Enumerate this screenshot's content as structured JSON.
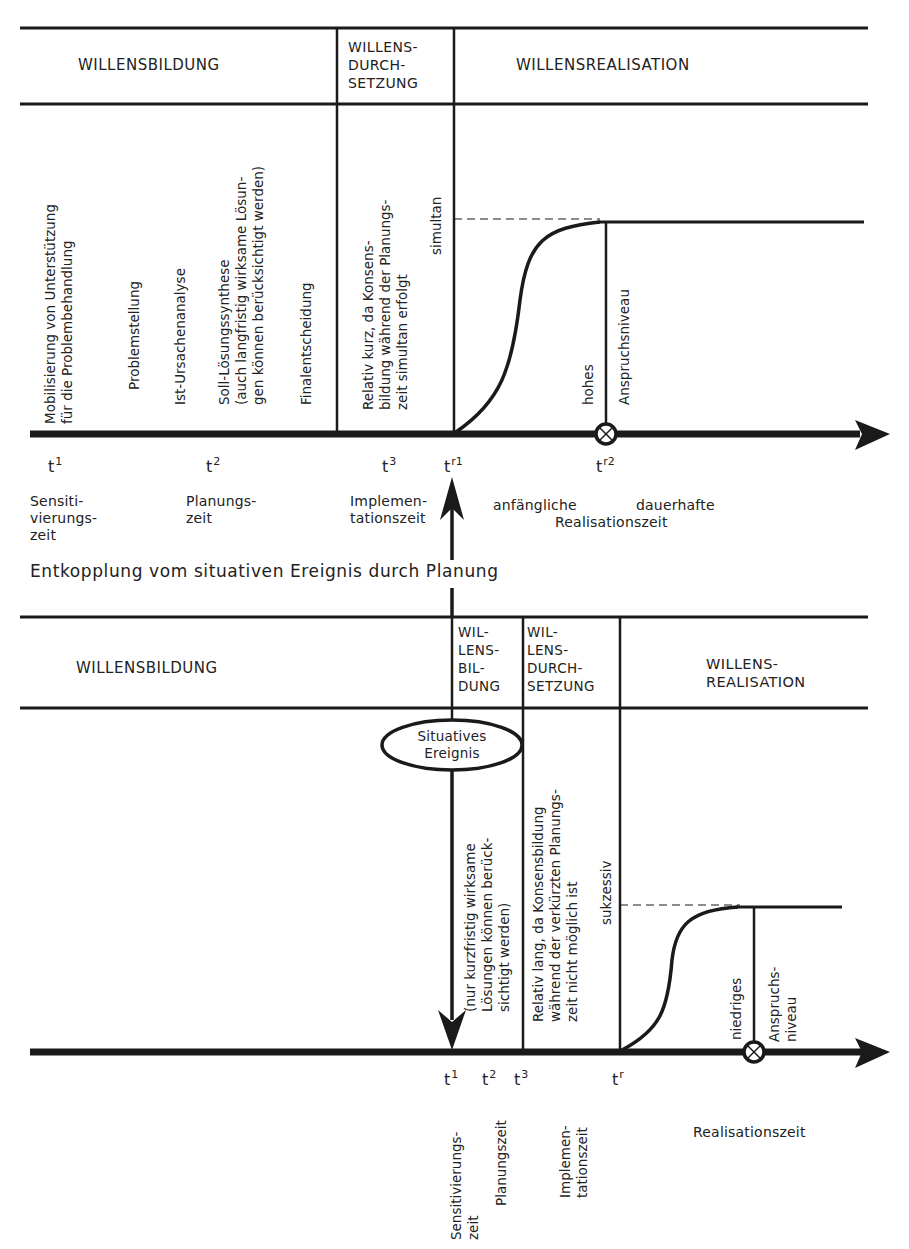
{
  "top_panel": {
    "phases": {
      "willensbildung": "WILLENSBILDUNG",
      "willensdurchsetzung": "WILLENS-\nDURCH-\nSETZUNG",
      "willensrealisation": "WILLENSREALISATION"
    },
    "activities": {
      "mobilisierung": "Mobilisierung von Unterstützung\nfür die Problembehandlung",
      "problemstellung": "Problemstellung",
      "ist_ursachenanalyse": "Ist-Ursachenanalyse",
      "soll_loesungssynthese": "Soll-Lösungssynthese\n(auch langfristig wirksame Lösun-\ngen können berücksichtigt werden)",
      "finalentscheidung": "Finalentscheidung",
      "implementation_note": "Relativ kurz, da Konsens-\nbildung während der Planungs-\nzeit simultan erfolgt",
      "simultan": "simultan",
      "hohes": "hohes",
      "anspruchsniveau": "Anspruchsniveau"
    },
    "ticks": [
      {
        "base": "t",
        "sup": "1"
      },
      {
        "base": "t",
        "sup": "2"
      },
      {
        "base": "t",
        "sup": "3"
      },
      {
        "base": "t",
        "sup": "r1"
      },
      {
        "base": "t",
        "sup": "r2"
      }
    ],
    "periods": {
      "sensitivierungszeit": "Sensiti-\nvierungs-\nzeit",
      "planungszeit": "Planungs-\nzeit",
      "implementationszeit": "Implemen-\ntationszeit",
      "anfaengliche": "anfängliche",
      "dauerhafte": "dauerhafte",
      "realisationszeit": "Realisationszeit"
    }
  },
  "middle_caption": "Entkopplung vom situativen Ereignis durch Planung",
  "bottom_panel": {
    "phases": {
      "willensbildung": "WILLENSBILDUNG",
      "willensbildung_short": "WIL-\nLENS-\nBIL-\nDUNG",
      "willensdurchsetzung": "WIL-\nLENS-\nDURCH-\nSETZUNG",
      "willensrealisation": "WILLENS-\nREALISATION"
    },
    "event": "Situatives\nEreignis",
    "activities": {
      "kurzfristig_note": "(nur kurzfristig wirksame\nLösungen können berück-\nsichtigt werden)",
      "implementation_note": "Relativ lang, da Konsensbildung\nwährend der verkürzten Planungs-\nzeit nicht möglich ist",
      "sukzessiv": "sukzessiv",
      "niedriges": "niedriges",
      "anspruchsniveau": "Anspruchs-\nniveau"
    },
    "ticks": [
      {
        "base": "t",
        "sup": "1"
      },
      {
        "base": "t",
        "sup": "2"
      },
      {
        "base": "t",
        "sup": "3"
      },
      {
        "base": "t",
        "sup": "r"
      }
    ],
    "periods": {
      "sensitivierungszeit": "Sensitivierungs-\nzeit",
      "planungszeit": "Planungszeit",
      "implementationszeit": "Implemen-\ntationszeit",
      "realisationszeit": "Realisationszeit"
    }
  },
  "colors": {
    "ink": "#1a1a1a",
    "background": "#ffffff"
  }
}
